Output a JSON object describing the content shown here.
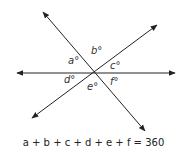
{
  "diagram": {
    "type": "intersecting-lines",
    "line_color": "#222222",
    "lines": [
      {
        "name": "horizontal",
        "from": [
          17,
          73
        ],
        "to": [
          175,
          73
        ],
        "arrows": "both"
      },
      {
        "name": "descending",
        "from": [
          43,
          12
        ],
        "to": [
          145,
          131
        ],
        "arrows": "both"
      },
      {
        "name": "ascending",
        "from": [
          32,
          118
        ],
        "to": [
          157,
          25
        ],
        "arrows": "both"
      }
    ],
    "intersection": [
      94,
      73
    ],
    "angles": [
      {
        "id": "a",
        "label": "a°",
        "pos": [
          68,
          61
        ]
      },
      {
        "id": "b",
        "label": "b°",
        "pos": [
          94,
          51
        ]
      },
      {
        "id": "c",
        "label": "c°",
        "pos": [
          110,
          64
        ]
      },
      {
        "id": "d",
        "label": "d°",
        "pos": [
          66,
          76
        ]
      },
      {
        "id": "e",
        "label": "e°",
        "pos": [
          88,
          84
        ]
      },
      {
        "id": "f",
        "label": "f°",
        "pos": [
          110,
          78
        ]
      }
    ],
    "equation": "a + b + c + d + e + f = 360"
  }
}
